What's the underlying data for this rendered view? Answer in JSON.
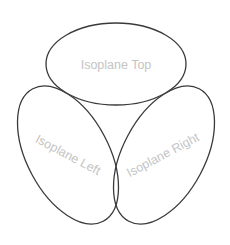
{
  "diagram": {
    "shapes": [
      {
        "id": "top",
        "label": "Isoplane Top"
      },
      {
        "id": "left",
        "label": "Isoplane Left"
      },
      {
        "id": "right",
        "label": "Isoplane Right"
      }
    ],
    "colors": {
      "stroke": "#3a3a3a",
      "label": "#c4c4c4",
      "background": "#ffffff"
    }
  }
}
